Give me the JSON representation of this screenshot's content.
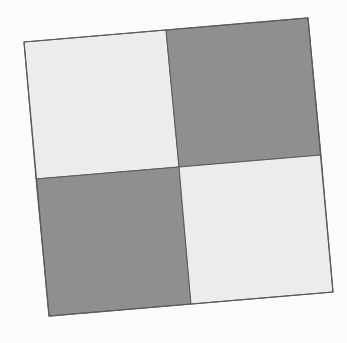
{
  "figure": {
    "background": "#fbfbfb",
    "colors": {
      "light": "#ececec",
      "dark": "#8f8f8f",
      "border": "#5a5a5a"
    },
    "corners": {
      "tl": [
        24,
        42
      ],
      "tr": [
        308,
        18
      ],
      "br": [
        333,
        292
      ],
      "bl": [
        49,
        316
      ]
    },
    "center": [
      179,
      167
    ],
    "edge_mids": {
      "top": [
        166,
        30
      ],
      "right": [
        321,
        155
      ],
      "bottom": [
        191,
        304
      ],
      "left": [
        36,
        179
      ]
    },
    "cells": [
      {
        "position": "top-left",
        "shade": "light"
      },
      {
        "position": "top-right",
        "shade": "dark"
      },
      {
        "position": "bottom-left",
        "shade": "dark"
      },
      {
        "position": "bottom-right",
        "shade": "light"
      }
    ]
  }
}
